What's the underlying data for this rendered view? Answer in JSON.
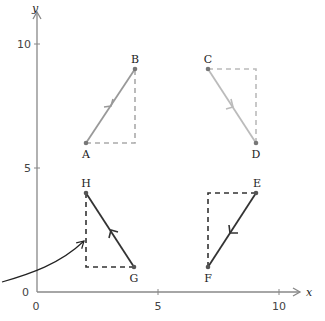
{
  "axes": {
    "x_label": "x",
    "y_label": "y",
    "x_ticks": [
      {
        "value": 0,
        "label": "0"
      },
      {
        "value": 5,
        "label": "5"
      },
      {
        "value": 10,
        "label": "10"
      }
    ],
    "y_ticks": [
      {
        "value": 0,
        "label": "0"
      },
      {
        "value": 5,
        "label": "5"
      },
      {
        "value": 10,
        "label": "10"
      }
    ],
    "color": "#888888"
  },
  "vectors": [
    {
      "id": "AB",
      "from": {
        "label": "A",
        "x": 2,
        "y": 6
      },
      "to": {
        "label": "B",
        "x": 4,
        "y": 9
      },
      "color": "#999999",
      "dash_color": "#aaaaaa",
      "corner": {
        "x": 4,
        "y": 6
      }
    },
    {
      "id": "CD",
      "from": {
        "label": "C",
        "x": 7,
        "y": 9
      },
      "to": {
        "label": "D",
        "x": 9,
        "y": 6
      },
      "color": "#bbbbbb",
      "dash_color": "#bbbbbb",
      "corner": {
        "x": 9,
        "y": 9
      }
    },
    {
      "id": "GH",
      "from": {
        "label": "G",
        "x": 4,
        "y": 1
      },
      "to": {
        "label": "H",
        "x": 2,
        "y": 4
      },
      "color": "#333333",
      "dash_color": "#333333",
      "corner": {
        "x": 2,
        "y": 1
      }
    },
    {
      "id": "EF",
      "from": {
        "label": "E",
        "x": 9,
        "y": 4
      },
      "to": {
        "label": "F",
        "x": 7,
        "y": 1
      },
      "color": "#333333",
      "dash_color": "#333333",
      "corner": {
        "x": 7,
        "y": 4
      }
    }
  ],
  "pointer": {
    "description": "curved arrow pointing to dashed vertical leg of GH triangle"
  }
}
